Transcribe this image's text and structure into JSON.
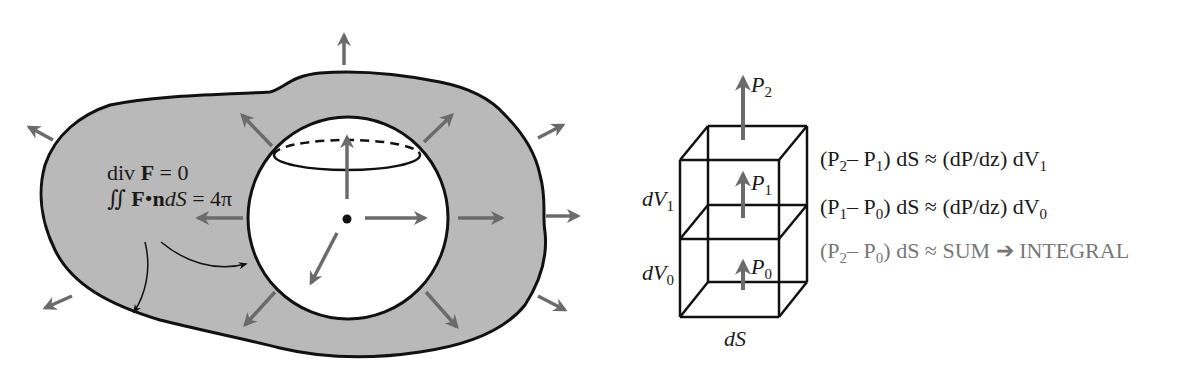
{
  "left_panel": {
    "label_line1": {
      "prefix": "div ",
      "bold": "F",
      "suffix": " = 0"
    },
    "label_line2": {
      "integral": "∬",
      "bold_F": "F",
      "dot": "•",
      "bold_n": "n",
      "italic": "dS",
      "suffix": " = 4π"
    }
  },
  "right_panel": {
    "arrow_labels": {
      "p2": {
        "base": "P",
        "sub": "2"
      },
      "p1": {
        "base": "P",
        "sub": "1"
      },
      "p0": {
        "base": "P",
        "sub": "0"
      }
    },
    "volume_labels": {
      "dv1": {
        "base": "dV",
        "sub": "1"
      },
      "dv0": {
        "base": "dV",
        "sub": "0"
      }
    },
    "bottom_label": "dS",
    "equations": [
      {
        "a": "(P",
        "a_sub": "2",
        "b": "– P",
        "b_sub": "1",
        "c": ") dS ≈ (dP/dz) dV",
        "c_sub": "1"
      },
      {
        "a": "(P",
        "a_sub": "1",
        "b": "– P",
        "b_sub": "0",
        "c": ") dS ≈ (dP/dz) dV",
        "c_sub": "0"
      },
      {
        "a": "(P",
        "a_sub": "2",
        "b": "– P",
        "b_sub": "0",
        "c": ") dS ≈ SUM ➔ INTEGRAL",
        "c_sub": ""
      }
    ]
  },
  "colors": {
    "region_fill": "#b9b9b9",
    "outline": "#111111",
    "arrow": "#6b6b6b",
    "equation_faint": "#777777"
  }
}
